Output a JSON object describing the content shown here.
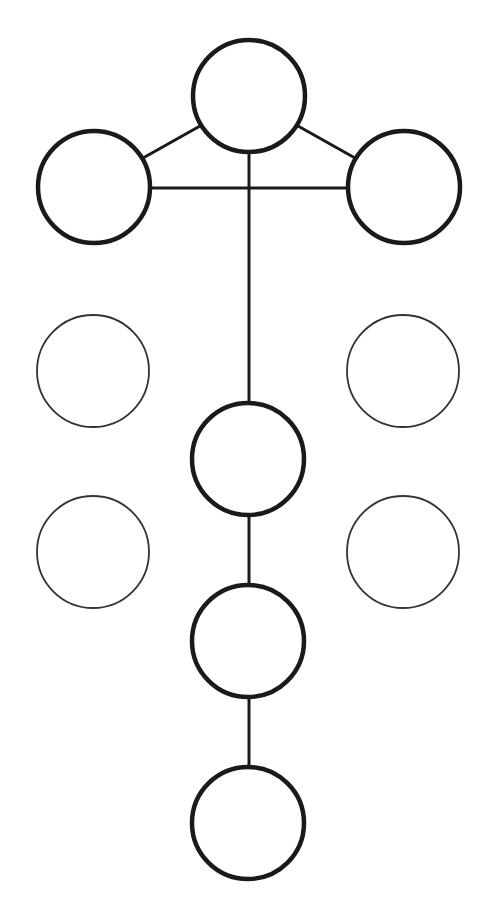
{
  "diagram": {
    "width": 485,
    "height": 904,
    "background": "#ffffff",
    "stroke_color": "#1a1a1a",
    "faint_stroke_color": "#333333",
    "nodes": [
      {
        "id": "top",
        "cx": 249,
        "cy": 96,
        "r": 56,
        "style": "bold"
      },
      {
        "id": "upper-left",
        "cx": 94,
        "cy": 187,
        "r": 56,
        "style": "bold"
      },
      {
        "id": "upper-right",
        "cx": 404,
        "cy": 187,
        "r": 56,
        "style": "bold"
      },
      {
        "id": "mid-left-1",
        "cx": 93,
        "cy": 371,
        "r": 56,
        "style": "thin"
      },
      {
        "id": "mid-right-1",
        "cx": 403,
        "cy": 371,
        "r": 56,
        "style": "thin"
      },
      {
        "id": "center-1",
        "cx": 248,
        "cy": 459,
        "r": 56,
        "style": "bold"
      },
      {
        "id": "mid-left-2",
        "cx": 93,
        "cy": 552,
        "r": 56,
        "style": "thin"
      },
      {
        "id": "mid-right-2",
        "cx": 403,
        "cy": 552,
        "r": 56,
        "style": "thin"
      },
      {
        "id": "center-2",
        "cx": 248,
        "cy": 641,
        "r": 56,
        "style": "bold"
      },
      {
        "id": "center-3",
        "cx": 248,
        "cy": 823,
        "r": 56,
        "style": "bold"
      }
    ],
    "edges": [
      {
        "from": "top",
        "to": "upper-left",
        "x1": 200,
        "y1": 126,
        "x2": 143,
        "y2": 158
      },
      {
        "from": "top",
        "to": "upper-right",
        "x1": 298,
        "y1": 126,
        "x2": 355,
        "y2": 158
      },
      {
        "from": "upper-left",
        "to": "upper-right",
        "x1": 150,
        "y1": 188,
        "x2": 348,
        "y2": 188
      },
      {
        "from": "top",
        "to": "center-1",
        "x1": 249,
        "y1": 152,
        "x2": 249,
        "y2": 403
      },
      {
        "from": "center-1",
        "to": "center-2",
        "x1": 249,
        "y1": 515,
        "x2": 249,
        "y2": 585
      },
      {
        "from": "center-2",
        "to": "center-3",
        "x1": 249,
        "y1": 697,
        "x2": 249,
        "y2": 767
      }
    ]
  }
}
